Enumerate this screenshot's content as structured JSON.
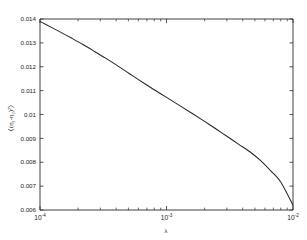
{
  "figure": {
    "background_color": "#ffffff",
    "axis_color": "#2b2b2b",
    "curve_color": "#262626"
  },
  "chart_data": {
    "type": "line",
    "title": "",
    "subtitle": "",
    "xlabel": "λ",
    "ylabel": "〈(η₁-η₂)²〉",
    "ylabel_parts": {
      "open_bracket": "〈",
      "open_paren": "(",
      "sym1": "η",
      "sub1": "1",
      "minus": "-",
      "sym2": "η",
      "sub2": "2",
      "close_paren": ")",
      "power": "2",
      "close_bracket": "〉"
    },
    "xscale": "log",
    "yscale": "linear",
    "xlim": [
      0.0001,
      0.01
    ],
    "ylim": [
      0.006,
      0.014
    ],
    "grid": false,
    "legend": null,
    "legend_position": "none",
    "xticks": [
      {
        "value": 0.0001,
        "base": "10",
        "exponent": "-4"
      },
      {
        "value": 0.001,
        "base": "10",
        "exponent": "-3"
      },
      {
        "value": 0.01,
        "base": "10",
        "exponent": "-2"
      }
    ],
    "yticks": [
      {
        "value": 0.014,
        "label": "0.014"
      },
      {
        "value": 0.013,
        "label": "0.013"
      },
      {
        "value": 0.012,
        "label": "0.012"
      },
      {
        "value": 0.011,
        "label": "0.011"
      },
      {
        "value": 0.01,
        "label": "0.01"
      },
      {
        "value": 0.009,
        "label": "0.009"
      },
      {
        "value": 0.008,
        "label": "0.008"
      },
      {
        "value": 0.007,
        "label": "0.007"
      },
      {
        "value": 0.006,
        "label": "0.006"
      }
    ],
    "series": [
      {
        "name": "mean squared difference",
        "color": "#262626",
        "x": [
          0.0001,
          0.00012,
          0.00015,
          0.00018,
          0.00022,
          0.00027,
          0.00033,
          0.0004,
          0.0005,
          0.0006,
          0.00075,
          0.0009,
          0.0011,
          0.0013,
          0.0016,
          0.002,
          0.0025,
          0.003,
          0.0037,
          0.0045,
          0.0055,
          0.0067,
          0.008,
          0.01
        ],
        "y": [
          0.0139,
          0.01368,
          0.01341,
          0.01318,
          0.01292,
          0.01264,
          0.01236,
          0.01208,
          0.01174,
          0.01146,
          0.01113,
          0.01087,
          0.01058,
          0.01034,
          0.01004,
          0.00971,
          0.00937,
          0.00909,
          0.00876,
          0.00846,
          0.00809,
          0.00763,
          0.00717,
          0.0062
        ]
      }
    ]
  }
}
